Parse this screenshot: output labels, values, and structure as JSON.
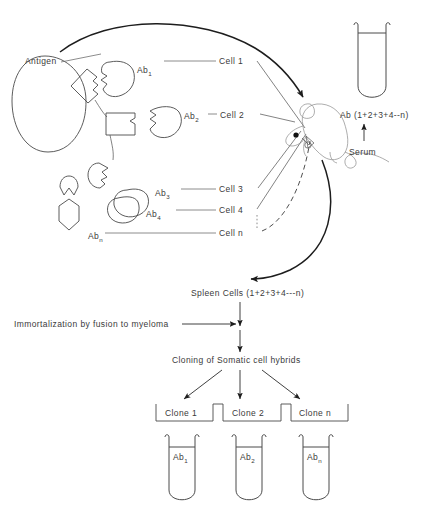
{
  "figure": {
    "type": "diagram",
    "background_color": "#ffffff",
    "line_color": "#4a4a4a",
    "text_color": "#3a3a3a"
  },
  "antigen": {
    "label": "Antigen",
    "epitope_antibodies": [
      {
        "name": "Ab",
        "subscript": "1"
      },
      {
        "name": "Ab",
        "subscript": "2"
      },
      {
        "name": "Ab",
        "subscript": "3"
      },
      {
        "name": "Ab",
        "subscript": "4"
      },
      {
        "name": "Ab",
        "subscript": "n"
      }
    ]
  },
  "cells": [
    {
      "label": "Cell 1"
    },
    {
      "label": "Cell 2"
    },
    {
      "label": "Cell 3"
    },
    {
      "label": "Cell 4"
    },
    {
      "label": "Cell n"
    }
  ],
  "animal": {
    "name": "mouse"
  },
  "serum_tube": {
    "contents_label": "Ab (1+2+3+4--n)",
    "source_label": "Serum"
  },
  "flow": {
    "spleen_cells": "Spleen Cells (1+2+3+4---n)",
    "fusion_step": "Immortalization by fusion to myeloma",
    "cloning_step": "Cloning of Somatic cell hybrids"
  },
  "clones": [
    {
      "label": "Clone 1"
    },
    {
      "label": "Clone 2"
    },
    {
      "label": "Clone n"
    }
  ],
  "clone_tubes": [
    {
      "name": "Ab",
      "subscript": "1"
    },
    {
      "name": "Ab",
      "subscript": "2"
    },
    {
      "name": "Ab",
      "subscript": "n"
    }
  ]
}
